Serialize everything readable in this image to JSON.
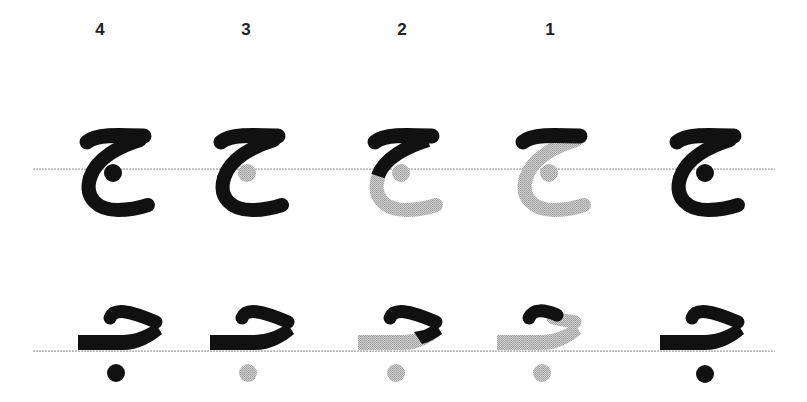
{
  "diagram": {
    "colors": {
      "ink": "#111111",
      "pending": "#bdbdbd",
      "guideline": "#b0b0b0",
      "background": "#ffffff",
      "label": "#222222"
    },
    "step_labels": [
      {
        "text": "4",
        "x": 100
      },
      {
        "text": "3",
        "x": 246
      },
      {
        "text": "2",
        "x": 402
      },
      {
        "text": "1",
        "x": 550
      }
    ],
    "guidelines": [
      {
        "row": "isolated",
        "y": 169,
        "x1": 32,
        "x2": 775
      },
      {
        "row": "initial",
        "y": 351,
        "x1": 32,
        "x2": 775
      }
    ],
    "rows": [
      {
        "form": "isolated",
        "columns": [
          {
            "step": "4",
            "x": 78,
            "state": "complete"
          },
          {
            "step": "3",
            "x": 212,
            "state": "body-done-dot-pending"
          },
          {
            "step": "2",
            "x": 366,
            "state": "top-and-diagonal-done"
          },
          {
            "step": "1",
            "x": 514,
            "state": "top-bar-done"
          },
          {
            "step": "final",
            "x": 668,
            "state": "complete"
          }
        ]
      },
      {
        "form": "initial",
        "columns": [
          {
            "step": "4",
            "x": 78,
            "state": "complete"
          },
          {
            "step": "3",
            "x": 210,
            "state": "body-done-dot-pending"
          },
          {
            "step": "2",
            "x": 358,
            "state": "hook-done"
          },
          {
            "step": "1",
            "x": 497,
            "state": "hook-start-done"
          },
          {
            "step": "final",
            "x": 660,
            "state": "complete"
          }
        ]
      }
    ]
  }
}
